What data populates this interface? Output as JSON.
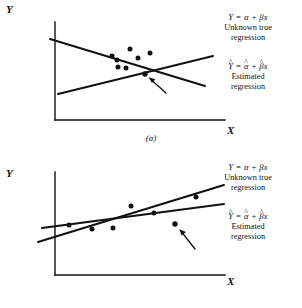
{
  "figure": {
    "width": 302,
    "height": 308,
    "background": "#ffffff",
    "ink": "#111111"
  },
  "panels": [
    {
      "id": "a",
      "caption": "(a)",
      "axes": {
        "y_label": "Y",
        "x_label": "X",
        "origin": [
          55,
          120
        ],
        "y_top": [
          55,
          22
        ],
        "x_right": [
          225,
          120
        ]
      },
      "annotations": [
        {
          "id": "unknown-true-regression-a",
          "formula_parts": {
            "lhs": "Y",
            "eq": "=",
            "intercept": "α",
            "plus": "+",
            "slope": "β",
            "x": "x"
          },
          "formula_plain": "Y = α + βx",
          "caption_lines": [
            "Unknown true",
            "regression"
          ]
        },
        {
          "id": "estimated-regression-a",
          "formula_parts": {
            "lhs": "Y",
            "lhs_hat": true,
            "eq": "=",
            "intercept": "α",
            "intercept_hat": true,
            "plus": "+",
            "slope": "β",
            "slope_hat": true,
            "x": "x"
          },
          "formula_plain": "Ŷ = α̂ + β̂x",
          "caption_lines": [
            "Estimated",
            "regression"
          ]
        }
      ],
      "lines": [
        {
          "id": "true-regression-line-a",
          "role": "unknown true regression",
          "slope_sign": "positive",
          "from": [
            58,
            94
          ],
          "to": [
            213,
            56
          ]
        },
        {
          "id": "estimated-regression-line-a",
          "role": "estimated regression",
          "slope_sign": "negative",
          "from": [
            50,
            39
          ],
          "to": [
            205,
            86
          ]
        }
      ],
      "points": [
        [
          112,
          56
        ],
        [
          130,
          49
        ],
        [
          117,
          60
        ],
        [
          138,
          58
        ],
        [
          150,
          53
        ],
        [
          118,
          67
        ],
        [
          126,
          68
        ],
        [
          145,
          74
        ]
      ],
      "arrow": {
        "id": "outlier-arrow-a",
        "from": [
          166,
          93
        ],
        "to": [
          149,
          78
        ],
        "target_point": [
          145,
          74
        ]
      }
    },
    {
      "id": "b",
      "caption": "(b)",
      "axes": {
        "y_label": "Y",
        "x_label": "X",
        "origin": [
          55,
          121
        ],
        "y_top": [
          55,
          18
        ],
        "x_right": [
          225,
          121
        ]
      },
      "annotations": [
        {
          "id": "unknown-true-regression-b",
          "formula_parts": {
            "lhs": "Y",
            "eq": "=",
            "intercept": "α",
            "plus": "+",
            "slope": "β",
            "x": "x"
          },
          "formula_plain": "Y = α + βx",
          "caption_lines": [
            "Unknown true",
            "regression"
          ]
        },
        {
          "id": "estimated-regression-b",
          "formula_parts": {
            "lhs": "Y",
            "lhs_hat": true,
            "eq": "=",
            "intercept": "α",
            "intercept_hat": true,
            "plus": "+",
            "slope": "β",
            "slope_hat": true,
            "x": "x"
          },
          "formula_plain": "Ŷ = α̂ + β̂x",
          "caption_lines": [
            "Estimated",
            "regression"
          ]
        }
      ],
      "lines": [
        {
          "id": "true-regression-line-b",
          "role": "unknown true regression",
          "slope_sign": "positive-steep",
          "from": [
            38,
            88
          ],
          "to": [
            224,
            31
          ]
        },
        {
          "id": "estimated-regression-line-b",
          "role": "estimated regression",
          "slope_sign": "positive-shallow",
          "from": [
            42,
            74
          ],
          "to": [
            224,
            50
          ]
        }
      ],
      "points": [
        [
          69,
          71
        ],
        [
          92,
          75
        ],
        [
          113,
          74
        ],
        [
          131,
          52
        ],
        [
          154,
          59
        ],
        [
          196,
          43
        ],
        [
          175,
          70
        ]
      ],
      "arrow": {
        "id": "outlier-arrow-b",
        "from": [
          195,
          95
        ],
        "to": [
          180,
          76
        ],
        "target_point": [
          175,
          70
        ]
      }
    }
  ]
}
